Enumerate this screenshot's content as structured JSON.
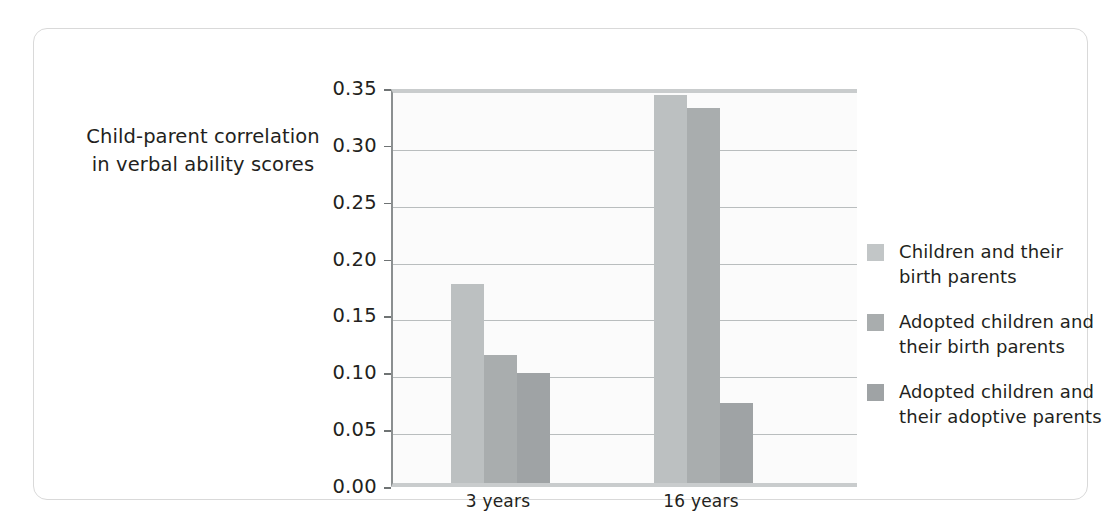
{
  "chart_data": {
    "type": "bar",
    "title": "",
    "xlabel": "",
    "ylabel": "Child-parent correlation\nin verbal ability scores",
    "categories": [
      "3 years",
      "16 years"
    ],
    "series": [
      {
        "name": "Children and their\nbirth parents",
        "color": "#bcc0c1",
        "values": [
          0.175,
          0.341
        ]
      },
      {
        "name": "Adopted children and\ntheir birth parents",
        "color": "#a9adae",
        "values": [
          0.113,
          0.33
        ]
      },
      {
        "name": "Adopted children and\ntheir adoptive parents",
        "color": "#9fa3a5",
        "values": [
          0.097,
          0.07
        ]
      }
    ],
    "ylim": [
      0.0,
      0.35
    ],
    "ytick_step": 0.05,
    "ytick_labels": [
      "0.00",
      "0.05",
      "0.10",
      "0.15",
      "0.20",
      "0.25",
      "0.30",
      "0.35"
    ],
    "ytick_values": [
      0.0,
      0.05,
      0.1,
      0.15,
      0.2,
      0.25,
      0.3,
      0.35
    ],
    "grid": true,
    "legend_position": "right",
    "plot_background": "#fbfbfb",
    "gridline_color": "#b9bdbe",
    "axis_color": "#8b8f90"
  },
  "layout": {
    "bar_width_px": 33,
    "group_centers_px": [
      107,
      310
    ],
    "group_gap_px": 0,
    "card_border_color": "#d9d9d9"
  }
}
